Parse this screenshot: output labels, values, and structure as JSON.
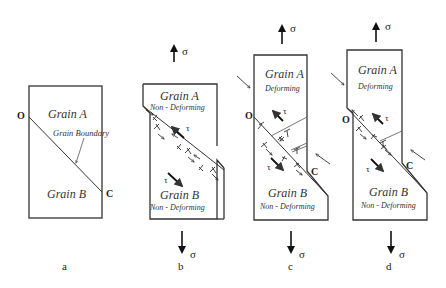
{
  "figure": {
    "panels": [
      {
        "id": "a",
        "caption": "a",
        "grain_a": "Grain A",
        "grain_b": "Grain B",
        "boundary_label": "Grain Boundary",
        "point_o": "O",
        "point_c": "C"
      },
      {
        "id": "b",
        "caption": "b",
        "grain_a": "Grain A",
        "grain_a_state": "Non - Deforming",
        "grain_b": "Grain B",
        "grain_b_state": "Non - Deforming",
        "stress_top": "σ",
        "stress_bottom": "σ",
        "shear_top": "τ",
        "shear_bottom": "τ"
      },
      {
        "id": "c",
        "caption": "c",
        "grain_a": "Grain A",
        "grain_a_state": "Deforming",
        "grain_b": "Grain B",
        "grain_b_state": "Non - Deforming",
        "stress_top": "σ",
        "stress_bottom": "σ",
        "shear_top": "τ",
        "shear_bottom": "τ",
        "point_o": "O",
        "point_c": "C"
      },
      {
        "id": "d",
        "caption": "d",
        "grain_a": "Grain A",
        "grain_a_state": "Deforming",
        "grain_b": "Grain B",
        "grain_b_state": "Non - Deforming",
        "stress_top": "σ",
        "stress_bottom": "σ",
        "shear_top": "τ",
        "shear_bottom": "τ",
        "point_o": "O",
        "point_c": "C"
      }
    ]
  }
}
